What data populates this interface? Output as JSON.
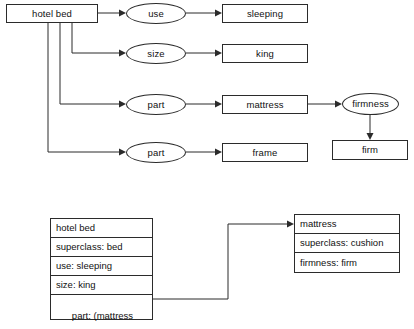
{
  "figure": {
    "kind": "semantic-network-and-frame-diagram",
    "background_color": "#ffffff",
    "line_color": "#2b2b2b",
    "text_color": "#111111"
  },
  "semantic_network": {
    "root_concept": "hotel bed",
    "relations": [
      {
        "arc_label": "use",
        "value": "sleeping"
      },
      {
        "arc_label": "size",
        "value": "king"
      },
      {
        "arc_label": "part",
        "value": "mattress"
      },
      {
        "arc_label": "part",
        "value": "frame"
      }
    ],
    "sub_relation": {
      "source": "mattress",
      "arc_label": "firmness",
      "value": "firm"
    }
  },
  "frames": {
    "left_frame": {
      "name": "left-frame-hotel-bed",
      "rows": [
        "hotel bed",
        "superclass: bed",
        "use: sleeping",
        "size: king"
      ],
      "last_row_line1": "part: (mattress",
      "last_row_line2": "          frame)"
    },
    "right_frame": {
      "name": "right-frame-mattress",
      "rows": [
        "mattress",
        "superclass: cushion",
        "firmness: firm"
      ]
    },
    "pointer": {
      "from_row": "part: (mattress",
      "to_frame": "mattress"
    }
  }
}
